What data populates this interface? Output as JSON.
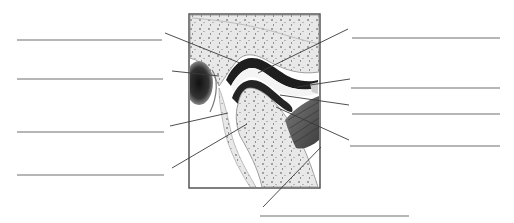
{
  "diagram": {
    "colors": {
      "background": "#ffffff",
      "frame": "#555555",
      "label_line": "#6f6f6f",
      "leader_line": "#3a3a3a",
      "bone": "#e6e6e6",
      "bone_speckle": "#9a9a9a",
      "cartilage_dark": "#1e1e1e",
      "muscle": "#5a5a5a",
      "cavity": "#2a2a2a"
    },
    "frame": {
      "x": 189,
      "y": 14,
      "w": 131,
      "h": 174
    },
    "labels": [
      {
        "id": "L1",
        "side": "left",
        "line": [
          17,
          40,
          162,
          40
        ],
        "leader": [
          165,
          33,
          240,
          63
        ],
        "text": ""
      },
      {
        "id": "L2",
        "side": "left",
        "line": [
          17,
          79,
          163,
          79
        ],
        "leader": [
          172,
          71,
          219,
          76
        ],
        "text": ""
      },
      {
        "id": "L3",
        "side": "left",
        "line": [
          17,
          132,
          164,
          132
        ],
        "leader": [
          170,
          126,
          228,
          113
        ],
        "text": ""
      },
      {
        "id": "L4",
        "side": "left",
        "line": [
          17,
          175,
          164,
          175
        ],
        "leader": [
          172,
          168,
          247,
          124
        ],
        "text": ""
      },
      {
        "id": "R1",
        "side": "right",
        "line": [
          352,
          38,
          500,
          38
        ],
        "leader": [
          348,
          29,
          258,
          73
        ],
        "text": ""
      },
      {
        "id": "R2",
        "side": "right",
        "line": [
          351,
          88,
          500,
          88
        ],
        "leader": [
          350,
          79,
          297,
          87
        ],
        "text": ""
      },
      {
        "id": "R3",
        "side": "right",
        "line": [
          352,
          114,
          500,
          114
        ],
        "leader": [
          349,
          105,
          280,
          95
        ],
        "text": ""
      },
      {
        "id": "R4",
        "side": "right",
        "line": [
          350,
          146,
          500,
          146
        ],
        "leader": [
          349,
          140,
          276,
          107
        ],
        "text": ""
      },
      {
        "id": "B1",
        "side": "bottom",
        "line": [
          260,
          216,
          409,
          216
        ],
        "leader": [
          263,
          207,
          321,
          147
        ],
        "text": ""
      }
    ]
  }
}
